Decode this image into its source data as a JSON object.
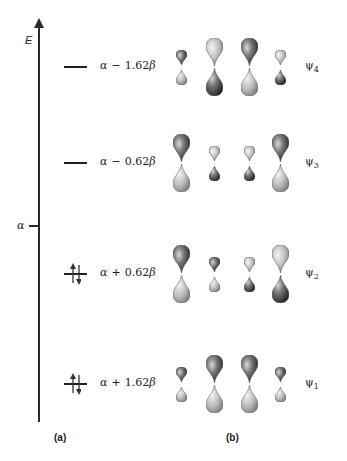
{
  "axis": {
    "label": "E",
    "reference_label": "α"
  },
  "levels": [
    {
      "id": "psi4",
      "energy_prefix": "α",
      "sign": "−",
      "coef": "1.62",
      "beta": "β",
      "energy": "α − 1.62β",
      "psi_label": "ψ4",
      "psi_base": "ψ",
      "psi_sub": "4",
      "occupied": false,
      "y": 67,
      "orbitals": [
        {
          "size": "small",
          "top": "dark"
        },
        {
          "size": "large",
          "top": "light"
        },
        {
          "size": "large",
          "top": "dark"
        },
        {
          "size": "small",
          "top": "light"
        }
      ]
    },
    {
      "id": "psi3",
      "energy_prefix": "α",
      "sign": "−",
      "coef": "0.62",
      "beta": "β",
      "energy": "α − 0.62β",
      "psi_label": "ψ3",
      "psi_base": "ψ",
      "psi_sub": "3",
      "occupied": false,
      "y": 163,
      "orbitals": [
        {
          "size": "large",
          "top": "dark"
        },
        {
          "size": "small",
          "top": "light"
        },
        {
          "size": "small",
          "top": "light"
        },
        {
          "size": "large",
          "top": "dark"
        }
      ]
    },
    {
      "id": "psi2",
      "energy_prefix": "α",
      "sign": "+",
      "coef": "0.62",
      "beta": "β",
      "energy": "α + 0.62β",
      "psi_label": "ψ2",
      "psi_base": "ψ",
      "psi_sub": "2",
      "occupied": true,
      "y": 274,
      "orbitals": [
        {
          "size": "large",
          "top": "dark"
        },
        {
          "size": "small",
          "top": "dark"
        },
        {
          "size": "small",
          "top": "light"
        },
        {
          "size": "large",
          "top": "light"
        }
      ]
    },
    {
      "id": "psi1",
      "energy_prefix": "α",
      "sign": "+",
      "coef": "1.62",
      "beta": "β",
      "energy": "α + 1.62β",
      "psi_label": "ψ1",
      "psi_base": "ψ",
      "psi_sub": "1",
      "occupied": true,
      "y": 384,
      "orbitals": [
        {
          "size": "small",
          "top": "dark"
        },
        {
          "size": "large",
          "top": "dark"
        },
        {
          "size": "large",
          "top": "dark"
        },
        {
          "size": "small",
          "top": "dark"
        }
      ]
    }
  ],
  "panels": {
    "a": "(a)",
    "b": "(b)"
  },
  "colors": {
    "dark_lobe": "#2e2e2e",
    "light_lobe": "#b8b8b8",
    "line": "#222222"
  }
}
